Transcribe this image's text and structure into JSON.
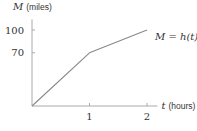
{
  "chart_data": {
    "type": "line",
    "title": "",
    "xlabel": {
      "var": "t",
      "unit": "(hours)"
    },
    "ylabel": {
      "var": "M",
      "unit": "(miles)"
    },
    "xlim": [
      0,
      2.2
    ],
    "ylim": [
      0,
      110
    ],
    "x_ticks": [
      1,
      2
    ],
    "x_tick_labels": [
      "1",
      "2"
    ],
    "y_ticks": [
      70,
      100
    ],
    "y_tick_labels": [
      "70",
      "100"
    ],
    "grid": false,
    "series": [
      {
        "name": "M = h(t)",
        "points": [
          [
            0,
            0
          ],
          [
            1,
            70
          ],
          [
            2,
            100
          ]
        ]
      }
    ],
    "annotations": [
      {
        "text": "M = h(t)",
        "position": "right of line end"
      }
    ],
    "colors": {
      "axis": "#aaaaaa",
      "line": "#888888",
      "text": "#333333"
    }
  }
}
